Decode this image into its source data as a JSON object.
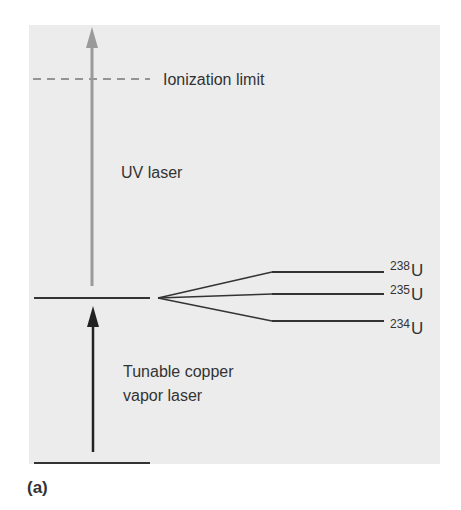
{
  "figure": {
    "caption": "(a)",
    "labels": {
      "ionization_limit": "Ionization limit",
      "uv_laser": "UV laser",
      "copper_laser_line1": "Tunable copper",
      "copper_laser_line2": "vapor laser"
    },
    "isotopes": [
      {
        "mass": "238",
        "symbol": "U"
      },
      {
        "mass": "235",
        "symbol": "U"
      },
      {
        "mass": "234",
        "symbol": "U"
      }
    ],
    "colors": {
      "background": "#ececec",
      "uv_arrow": "#9a9a9a",
      "copper_arrow": "#222222",
      "level_line": "#333333",
      "dashed_line": "#777777"
    }
  }
}
